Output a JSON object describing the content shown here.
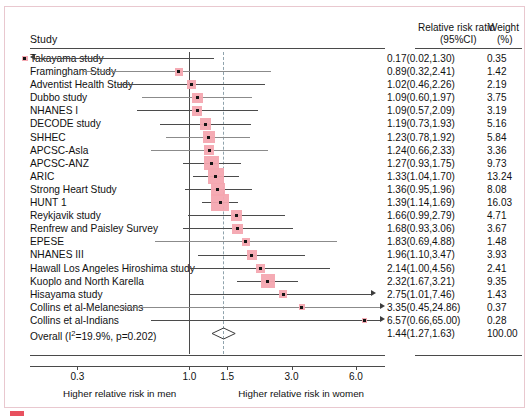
{
  "header": {
    "study_col": "Study",
    "rr_col_line1": "Relative risk ratio",
    "rr_col_line2": "(95%CI)",
    "weight_col_line1": "Weight",
    "weight_col_line2": "(%)"
  },
  "axis": {
    "ticks": [
      0.3,
      1.0,
      1.5,
      3.0,
      6.0
    ],
    "tick_labels": [
      "0.3",
      "1.0",
      "1.5",
      "3.0",
      "6.0"
    ],
    "left_caption": "Higher relative risk in men",
    "right_caption": "Higher relative risk in women",
    "null_line": 1.0,
    "pooled_line": 1.44,
    "scale": "log",
    "xmin": 0.18,
    "xmax": 8.2
  },
  "colors": {
    "marker": "#f4a6b0",
    "point": "#141414",
    "line": "#4b4b4b",
    "pooled_dash": "#8fa3ad",
    "frame": "#e9c8cf",
    "accent": "#e8515f"
  },
  "chart_data": {
    "type": "forest",
    "title": "",
    "xlabel": "Relative risk ratio (95%CI)",
    "ylabel": "Study",
    "xlim": [
      0.18,
      8.2
    ],
    "scale": "log",
    "grid": false,
    "null_value": 1.0,
    "pooled_value": 1.44,
    "heterogeneity": "I²=19.9%, p=0.202",
    "columns": [
      "Study",
      "Relative risk ratio (95%CI)",
      "Weight (%)"
    ],
    "rows": [
      {
        "study": "Takayama study",
        "rr": 0.17,
        "lo": 0.02,
        "hi": 1.3,
        "weight": 0.35,
        "rr_text": "0.17(0.02,1.30)",
        "weight_text": "0.35",
        "left_arrow": true,
        "right_arrow": false,
        "light": false
      },
      {
        "study": "Framingham Study",
        "rr": 0.89,
        "lo": 0.32,
        "hi": 2.41,
        "weight": 1.42,
        "rr_text": "0.89(0.32,2.41)",
        "weight_text": "1.42",
        "left_arrow": false,
        "right_arrow": false,
        "light": true
      },
      {
        "study": "Adventist Health Study",
        "rr": 1.02,
        "lo": 0.46,
        "hi": 2.26,
        "weight": 2.19,
        "rr_text": "1.02(0.46,2.26)",
        "weight_text": "2.19",
        "left_arrow": false,
        "right_arrow": false,
        "light": false
      },
      {
        "study": "Dubbo study",
        "rr": 1.09,
        "lo": 0.6,
        "hi": 1.97,
        "weight": 3.75,
        "rr_text": "1.09(0.60,1.97)",
        "weight_text": "3.75",
        "left_arrow": false,
        "right_arrow": false,
        "light": true
      },
      {
        "study": "NHANES I",
        "rr": 1.09,
        "lo": 0.57,
        "hi": 2.09,
        "weight": 3.19,
        "rr_text": "1.09(0.57,2.09)",
        "weight_text": "3.19",
        "left_arrow": false,
        "right_arrow": false,
        "light": false
      },
      {
        "study": "DECODE study",
        "rr": 1.19,
        "lo": 0.73,
        "hi": 1.93,
        "weight": 5.16,
        "rr_text": "1.19(0.73,1.93)",
        "weight_text": "5.16",
        "left_arrow": false,
        "right_arrow": false,
        "light": false
      },
      {
        "study": "SHHEC",
        "rr": 1.23,
        "lo": 0.78,
        "hi": 1.92,
        "weight": 5.84,
        "rr_text": "1.23(0.78,1.92)",
        "weight_text": "5.84",
        "left_arrow": false,
        "right_arrow": false,
        "light": true
      },
      {
        "study": "APCSC-Asla",
        "rr": 1.24,
        "lo": 0.66,
        "hi": 2.33,
        "weight": 3.36,
        "rr_text": "1.24(0.66,2.33)",
        "weight_text": "3.36",
        "left_arrow": false,
        "right_arrow": false,
        "light": true
      },
      {
        "study": "APCSC-ANZ",
        "rr": 1.27,
        "lo": 0.93,
        "hi": 1.75,
        "weight": 9.73,
        "rr_text": "1.27(0.93,1.75)",
        "weight_text": "9.73",
        "left_arrow": false,
        "right_arrow": false,
        "light": false
      },
      {
        "study": "ARIC",
        "rr": 1.33,
        "lo": 1.04,
        "hi": 1.7,
        "weight": 13.24,
        "rr_text": "1.33(1.04,1.70)",
        "weight_text": "13.24",
        "left_arrow": false,
        "right_arrow": false,
        "light": false
      },
      {
        "study": "Strong Heart Study",
        "rr": 1.36,
        "lo": 0.95,
        "hi": 1.96,
        "weight": 8.08,
        "rr_text": "1.36(0.95,1.96)",
        "weight_text": "8.08",
        "left_arrow": false,
        "right_arrow": false,
        "light": false
      },
      {
        "study": "HUNT 1",
        "rr": 1.39,
        "lo": 1.14,
        "hi": 1.69,
        "weight": 16.03,
        "rr_text": "1.39(1.14,1.69)",
        "weight_text": "16.03",
        "left_arrow": false,
        "right_arrow": false,
        "light": false
      },
      {
        "study": "Reykjavik study",
        "rr": 1.66,
        "lo": 0.99,
        "hi": 2.79,
        "weight": 4.71,
        "rr_text": "1.66(0.99,2.79)",
        "weight_text": "4.71",
        "left_arrow": false,
        "right_arrow": false,
        "light": false
      },
      {
        "study": "Renfrew and Paisley Survey",
        "rr": 1.68,
        "lo": 0.93,
        "hi": 3.06,
        "weight": 3.67,
        "rr_text": "1.68(0.93,3.06)",
        "weight_text": "3.67",
        "left_arrow": false,
        "right_arrow": false,
        "light": false
      },
      {
        "study": "EPESE",
        "rr": 1.83,
        "lo": 0.69,
        "hi": 4.88,
        "weight": 1.48,
        "rr_text": "1.83(0.69,4.88)",
        "weight_text": "1.48",
        "left_arrow": false,
        "right_arrow": false,
        "light": true
      },
      {
        "study": "NHANES III",
        "rr": 1.96,
        "lo": 1.1,
        "hi": 3.47,
        "weight": 3.93,
        "rr_text": "1.96(1.10,3.47)",
        "weight_text": "3.93",
        "left_arrow": false,
        "right_arrow": false,
        "light": false
      },
      {
        "study": "Hawall Los Angeles Hiroshima study",
        "rr": 2.14,
        "lo": 1.0,
        "hi": 4.56,
        "weight": 2.41,
        "rr_text": "2.14(1.00,4.56)",
        "weight_text": "2.41",
        "left_arrow": false,
        "right_arrow": false,
        "light": false
      },
      {
        "study": "Kuoplo and North Karella",
        "rr": 2.32,
        "lo": 1.67,
        "hi": 3.21,
        "weight": 9.35,
        "rr_text": "2.32(1.67,3.21)",
        "weight_text": "9.35",
        "left_arrow": false,
        "right_arrow": false,
        "light": false
      },
      {
        "study": "Hisayama study",
        "rr": 2.75,
        "lo": 1.01,
        "hi": 7.46,
        "weight": 1.43,
        "rr_text": "2.75(1.01,7.46)",
        "weight_text": "1.43",
        "left_arrow": false,
        "right_arrow": true,
        "light": false
      },
      {
        "study": "Collins et al-Melanesians",
        "rr": 3.35,
        "lo": 0.45,
        "hi": 24.86,
        "weight": 0.37,
        "rr_text": "3.35(0.45,24.86)",
        "weight_text": "0.37",
        "left_arrow": false,
        "right_arrow": true,
        "light": true
      },
      {
        "study": "Collins et al-Indians",
        "rr": 6.57,
        "lo": 0.66,
        "hi": 65.0,
        "weight": 0.28,
        "rr_text": "6.57(0.66,65.00)",
        "weight_text": "0.28",
        "left_arrow": false,
        "right_arrow": true,
        "light": false
      },
      {
        "study": "Overall (I²=19.9%, p=0.202)",
        "rr": 1.44,
        "lo": 1.27,
        "hi": 1.63,
        "weight": 100.0,
        "rr_text": "1.44(1.27,1.63)",
        "weight_text": "100.00",
        "left_arrow": false,
        "right_arrow": false,
        "light": false,
        "diamond": true
      }
    ]
  }
}
